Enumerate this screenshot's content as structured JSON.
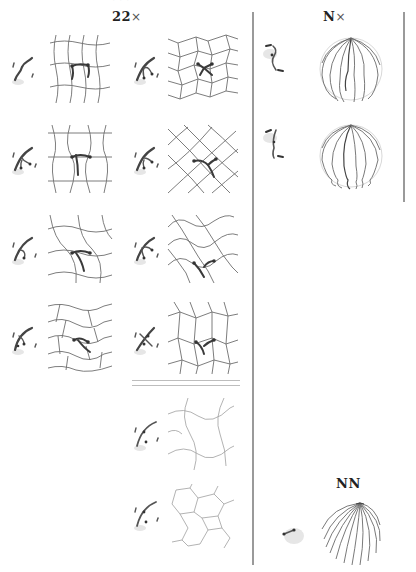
{
  "figure": {
    "top_cropped_text": "· · ·",
    "left_panel": {
      "title_main": "22",
      "title_suffix": "×",
      "rows": [
        {
          "index": 1,
          "cells": [
            {
              "glyph": "wavy-strand",
              "lattice": "square-wavy"
            },
            {
              "glyph": "branching-strand",
              "lattice": "brick-hex"
            }
          ]
        },
        {
          "index": 2,
          "cells": [
            {
              "glyph": "branching-strand",
              "lattice": "trapezoid"
            },
            {
              "glyph": "branching-strand",
              "lattice": "diagonal-square"
            }
          ]
        },
        {
          "index": 3,
          "cells": [
            {
              "glyph": "branching-strand",
              "lattice": "sine-wave"
            },
            {
              "glyph": "branching-strand",
              "lattice": "wavy-diamond"
            }
          ]
        },
        {
          "index": 4,
          "cells": [
            {
              "glyph": "branching-strand",
              "lattice": "wavy-brick"
            },
            {
              "glyph": "crossed-strand",
              "lattice": "irregular-quad"
            }
          ]
        }
      ],
      "extra_cells": [
        {
          "index": 5,
          "glyph": "dotted-strand",
          "lattice": "sparse-sine"
        },
        {
          "index": 6,
          "glyph": "dotted-strand",
          "lattice": "sparse-hex"
        }
      ]
    },
    "right_panel": {
      "title_main": "N",
      "title_suffix": "×",
      "spheres": [
        {
          "index": 1,
          "glyph": "hook-strand",
          "pattern": "meridian-branching"
        },
        {
          "index": 2,
          "glyph": "hook-strand",
          "pattern": "meridian-looped"
        }
      ]
    },
    "bottom_right": {
      "title": "NN",
      "glyph": "short-segment",
      "pattern": "swirl-meridians"
    },
    "colors": {
      "stroke": "#6e6e6e",
      "highlight": "#3a3a3a",
      "divider": "#9a9a9a"
    }
  }
}
